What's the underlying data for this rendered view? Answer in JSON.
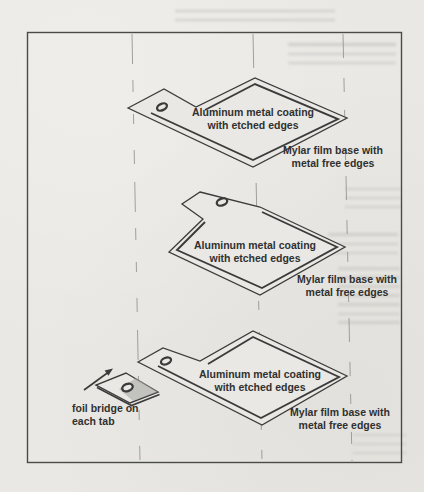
{
  "diagram": {
    "title_hint": "exploded view of metallized-film layers",
    "layers": [
      {
        "coating_line1": "Aluminum metal coating",
        "coating_line2": "with etched edges",
        "base_line1": "Mylar film base with",
        "base_line2": "metal free edges"
      },
      {
        "coating_line1": "Aluminum metal coating",
        "coating_line2": "with etched edges",
        "base_line1": "Mylar film base with",
        "base_line2": "metal free edges"
      },
      {
        "coating_line1": "Aluminum metal coating",
        "coating_line2": "with etched edges",
        "base_line1": "Mylar film base with",
        "base_line2": "metal free edges"
      }
    ],
    "foil_bridge": {
      "line1": "foil bridge on",
      "line2": "each tab"
    }
  },
  "colors": {
    "paper": "#e9e8e4",
    "line": "#3b3b3b",
    "text": "#303030",
    "shade": "#a9a9a7"
  }
}
